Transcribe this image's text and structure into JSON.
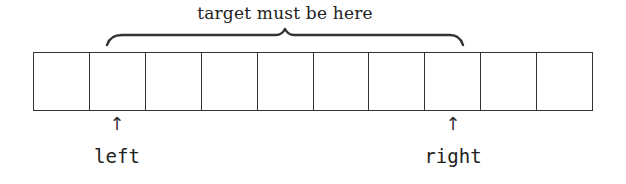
{
  "diagram": {
    "type": "array-binary-search-illustration",
    "brace": {
      "label": "target must be here",
      "from_cell": 1,
      "to_cell": 7
    },
    "array": {
      "cell_count": 10,
      "cells": [
        "",
        "",
        "",
        "",
        "",
        "",
        "",
        "",
        "",
        ""
      ]
    },
    "pointers": [
      {
        "name": "left",
        "label": "left",
        "cell_index": 1,
        "arrow": "↑"
      },
      {
        "name": "right",
        "label": "right",
        "cell_index": 7,
        "arrow": "↑"
      }
    ],
    "colors": {
      "stroke": "#333333",
      "text": "#222222",
      "background": "#ffffff"
    }
  }
}
